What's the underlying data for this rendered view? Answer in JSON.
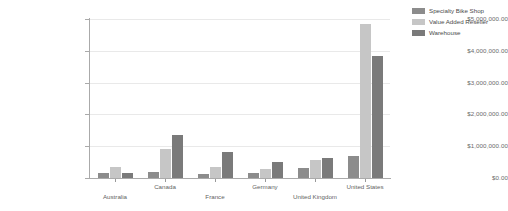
{
  "chart_data": {
    "type": "bar",
    "title": "",
    "xlabel": "",
    "ylabel": "",
    "grid": true,
    "legend_position": "right",
    "ylim": [
      0,
      5000000
    ],
    "ytick_values": [
      0,
      1000000,
      2000000,
      3000000,
      4000000,
      5000000
    ],
    "ytick_labels": [
      "$0.00",
      "$1,000,000.00",
      "$2,000,000.00",
      "$3,000,000.00",
      "$4,000,000.00",
      "$5,000,000.00"
    ],
    "categories": [
      "Australia",
      "Canada",
      "France",
      "Germany",
      "United Kingdom",
      "United States"
    ],
    "series": [
      {
        "name": "Specialty Bike Shop",
        "color": "#8c8c8c",
        "values": [
          160000,
          175000,
          130000,
          145000,
          320000,
          700000
        ]
      },
      {
        "name": "Value Added Reseller",
        "color": "#c6c6c6",
        "values": [
          350000,
          900000,
          360000,
          280000,
          570000,
          4850000
        ]
      },
      {
        "name": "Warehouse",
        "color": "#7a7a7a",
        "values": [
          170000,
          1350000,
          810000,
          500000,
          620000,
          3850000
        ]
      }
    ]
  },
  "legend": {
    "items": [
      {
        "label": "Specialty Bike Shop"
      },
      {
        "label": "Value Added Reseller"
      },
      {
        "label": "Warehouse"
      }
    ]
  },
  "axis": {
    "y_labels": [
      "$5,000,000.00",
      "$4,000,000.00",
      "$3,000,000.00",
      "$2,000,000.00",
      "$1,000,000.00",
      "$0.00"
    ],
    "x_labels": [
      "Australia",
      "Canada",
      "France",
      "Germany",
      "United Kingdom",
      "United States"
    ]
  }
}
